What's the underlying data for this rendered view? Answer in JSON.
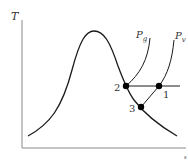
{
  "diagram": {
    "type": "T-s diagram",
    "axes": {
      "y_label": "T",
      "x_label": "s"
    },
    "curve_labels": {
      "pg_main": "P",
      "pg_sub": "g",
      "pv_main": "P",
      "pv_sub": "v"
    },
    "points": [
      {
        "id": "1",
        "label": "1"
      },
      {
        "id": "2",
        "label": "2"
      },
      {
        "id": "3",
        "label": "3"
      }
    ],
    "colors": {
      "line": "#1a1a1a",
      "axis": "#888888",
      "point": "#000000",
      "text": "#333333"
    }
  }
}
